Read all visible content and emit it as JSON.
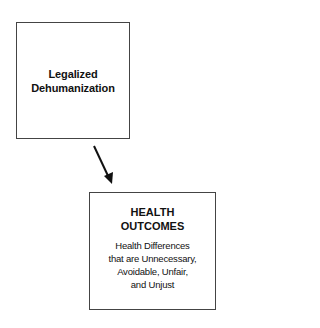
{
  "diagram": {
    "nodes": [
      {
        "id": "legalized-dehumanization",
        "title_lines": [
          "Legalized",
          "Dehumanization"
        ]
      },
      {
        "id": "health-outcomes",
        "title_lines": [
          "HEALTH",
          "OUTCOMES"
        ],
        "description_lines": [
          "Health Differences",
          "that are Unnecessary,",
          "Avoidable, Unfair,",
          "and Unjust"
        ]
      }
    ],
    "edges": [
      {
        "from": "legalized-dehumanization",
        "to": "health-outcomes",
        "style": "arrow",
        "color": "#111111"
      }
    ],
    "colors": {
      "border": "#444444",
      "text": "#111111",
      "background": "#ffffff"
    }
  }
}
